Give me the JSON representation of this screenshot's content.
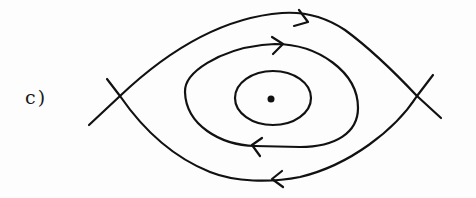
{
  "diagram": {
    "label": "c)",
    "type": "phase-portrait",
    "colors": {
      "stroke": "#111111",
      "background": "#fdfdfd"
    },
    "elements": {
      "center_point": {
        "x": 271,
        "y": 99
      },
      "saddles": [
        {
          "name": "left-saddle",
          "x": 120,
          "y": 96
        },
        {
          "name": "right-saddle",
          "x": 417,
          "y": 96
        }
      ],
      "closed_orbits": [
        {
          "name": "inner-orbit",
          "arrows": []
        },
        {
          "name": "middle-orbit",
          "arrows": [
            "top-right",
            "bottom-left"
          ],
          "direction": "clockwise"
        }
      ],
      "separatrix": {
        "name": "outer-heteroclinic-loop",
        "arrows": [
          "top-right",
          "bottom-left"
        ],
        "direction": "clockwise"
      }
    }
  }
}
